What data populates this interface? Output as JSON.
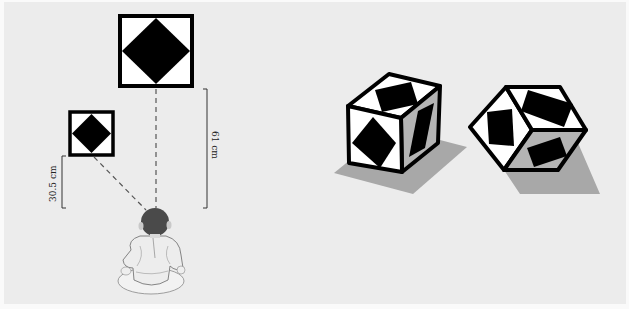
{
  "figure": {
    "left_panel": {
      "description": "Infant looking at near small pattern and far large pattern of equal retinal size",
      "near_target": {
        "name": "small-diamond-square",
        "distance_label": "30.5 cm"
      },
      "far_target": {
        "name": "large-diamond-square",
        "distance_label": "61 cm"
      }
    },
    "right_panel": {
      "description": "Two cubes with rotated square patterns shown from different viewpoints",
      "shapes": [
        {
          "name": "cube-oblique-view"
        },
        {
          "name": "cube-corner-view"
        }
      ]
    },
    "colors": {
      "background": "#ececec",
      "pattern_fill": "#000000",
      "pattern_ground": "#ffffff",
      "shadow": "#a8a8a8",
      "side_face": "#b4b4b4",
      "dash_line": "#555555",
      "baby_head": "#4a4a4a"
    }
  }
}
